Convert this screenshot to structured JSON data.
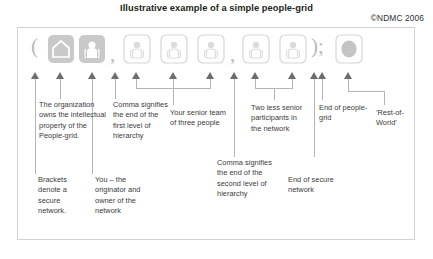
{
  "figure": {
    "title": "Illustrative example of a simple people-grid",
    "copyright": "©NDMC 2006"
  },
  "colors": {
    "arrow": "#6d6d6d",
    "leader_line": "#b5b5b5",
    "frame_border": "#d4d4d4",
    "tile_outline": "#d6d6d6",
    "tile_filled": "#c9c9c9",
    "punctuation": "#b9b9b9",
    "title_text": "#231f20"
  },
  "notation": {
    "open_bracket": "(",
    "comma_first": ",",
    "comma_second": ",",
    "close_bracket_semicolon": ");"
  },
  "icons": [
    {
      "id": "organization-tile",
      "glyph": "house-icon",
      "style": "filled",
      "label": "Organization"
    },
    {
      "id": "originator-tile",
      "glyph": "person-icon",
      "style": "filled",
      "label": "Originator"
    },
    {
      "id": "senior-tile-1",
      "glyph": "person-icon",
      "style": "outline",
      "label": "Senior team member 1"
    },
    {
      "id": "senior-tile-2",
      "glyph": "person-icon",
      "style": "outline",
      "label": "Senior team member 2"
    },
    {
      "id": "senior-tile-3",
      "glyph": "person-icon",
      "style": "outline",
      "label": "Senior team member 3"
    },
    {
      "id": "junior-tile-1",
      "glyph": "person-icon",
      "style": "outline",
      "label": "Less senior participant 1"
    },
    {
      "id": "junior-tile-2",
      "glyph": "person-icon",
      "style": "outline",
      "label": "Less senior participant 2"
    },
    {
      "id": "rest-of-world-tile",
      "glyph": "globe-icon",
      "style": "outline-filled",
      "label": "Rest-of-World"
    }
  ],
  "callouts": {
    "organization": "The organization owns the intellectual property of the People-grid.",
    "comma_first": "Comma signifies the end of the first level of hierarchy",
    "senior_team": "Your senior team of three people",
    "two_less_senior": "Two less senior participants in the network",
    "end_of_people_grid": "End of people-grid",
    "rest_of_world": "'Rest-of-World'",
    "brackets": "Brackets denote a secure network.",
    "originator": "You – the originator and owner of the network",
    "comma_second": "Comma signifies the end of the second level of hierarchy",
    "end_of_secure_network": "End of secure network"
  }
}
